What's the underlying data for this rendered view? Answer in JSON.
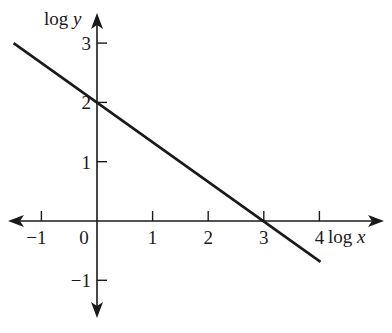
{
  "chart_data": {
    "type": "line",
    "title": "",
    "xlabel": "log x",
    "ylabel": "log y",
    "xlabel_parts": {
      "prefix": "log ",
      "var": "x"
    },
    "ylabel_parts": {
      "prefix": "log ",
      "var": "y"
    },
    "xlim": [
      -1.5,
      4.8
    ],
    "ylim": [
      -1.6,
      3.5
    ],
    "x_ticks": [
      -1,
      0,
      1,
      2,
      3,
      4
    ],
    "x_tick_labels": [
      "−1",
      "0",
      "1",
      "2",
      "3",
      "4"
    ],
    "y_ticks": [
      3,
      2,
      1,
      -1
    ],
    "y_tick_labels": [
      "3",
      "2",
      "1",
      "−1"
    ],
    "grid": false,
    "legend": null,
    "series": [
      {
        "name": "log y = 2 − (2/3) log x",
        "x": [
          -1.5,
          0,
          3,
          4
        ],
        "y": [
          3,
          2,
          0,
          -0.67
        ],
        "color": "#1a1a1a"
      }
    ],
    "annotations": {
      "y_intercept": 2,
      "x_intercept": 3,
      "slope": -0.6667
    }
  },
  "colors": {
    "axis": "#1a1a1a",
    "line": "#1a1a1a",
    "background": "#ffffff"
  }
}
